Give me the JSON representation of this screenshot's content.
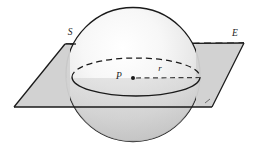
{
  "figure": {
    "type": "geometry-diagram",
    "background_color": "#ffffff",
    "labels": [
      {
        "id": "sphere",
        "text": "S",
        "x": 70,
        "y": 35,
        "style": "italic"
      },
      {
        "id": "plane",
        "text": "E",
        "x": 235,
        "y": 36,
        "style": "italic"
      },
      {
        "id": "center",
        "text": "P",
        "x": 119,
        "y": 79,
        "style": "italic"
      },
      {
        "id": "radius",
        "text": "r",
        "x": 160,
        "y": 71,
        "style": "italic"
      }
    ],
    "shapes": {
      "sphere": {
        "name": "sphere-S",
        "center_x": 133,
        "center_y": 74.5,
        "radius": 67,
        "outline_color": "#1a1a1a",
        "outline_width": 1.3,
        "fill_light": "#fdfdfd",
        "fill_mid": "#ededed",
        "fill_dark": "#c6c6c6"
      },
      "plane": {
        "name": "plane-E",
        "points": "65,44 244,43 212,107 14,107",
        "fill_color": "#d6d6d6",
        "outline_color": "#1a1a1a",
        "outline_width": 1.3,
        "opacity": 0.85
      },
      "intersection_circle": {
        "name": "great-circle",
        "center_x": 136,
        "center_y": 77,
        "radius_x": 64,
        "radius_y": 19,
        "stroke_color": "#1a1a1a",
        "stroke_width": 1.3,
        "front_visible": true,
        "back_dashed": true,
        "dash_pattern": "6,4"
      },
      "radius_segment": {
        "name": "radius-r",
        "from_x": 133,
        "from_y": 78,
        "to_x": 200,
        "to_y": 78,
        "stroke_color": "#4a4a4a",
        "stroke_width": 1.2,
        "dash_pattern": "5,3.5"
      },
      "center_point": {
        "name": "point-P",
        "x": 133,
        "y": 78,
        "radius": 2,
        "fill_color": "#1a1a1a"
      },
      "hidden_plane_edge": {
        "name": "plane-back-edge",
        "from_x": 66,
        "from_y": 44,
        "to_x": 244,
        "to_y": 43,
        "stroke_color": "#1a1a1a",
        "stroke_width": 1.3,
        "dash_pattern": "7,4.5"
      }
    }
  }
}
